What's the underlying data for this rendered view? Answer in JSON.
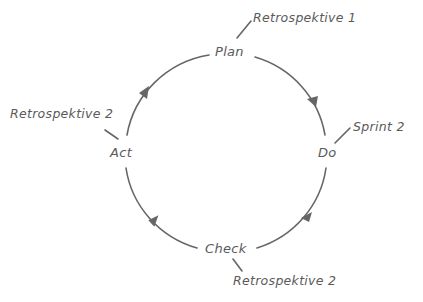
{
  "diagram": {
    "type": "cycle",
    "stroke_color": "#666666",
    "text_color": "#5a5a5a",
    "nodes": [
      {
        "id": "plan",
        "label": "Plan"
      },
      {
        "id": "do",
        "label": "Do"
      },
      {
        "id": "check",
        "label": "Check"
      },
      {
        "id": "act",
        "label": "Act"
      }
    ],
    "edges": [
      {
        "from": "plan",
        "to": "do"
      },
      {
        "from": "do",
        "to": "check"
      },
      {
        "from": "check",
        "to": "act"
      },
      {
        "from": "act",
        "to": "plan"
      }
    ],
    "annotations": [
      {
        "attached_to": "plan",
        "label": "Retrospektive 1"
      },
      {
        "attached_to": "do",
        "label": "Sprint 2"
      },
      {
        "attached_to": "check",
        "label": "Retrospektive 2"
      },
      {
        "attached_to": "act",
        "label": "Retrospektive 2"
      }
    ]
  }
}
